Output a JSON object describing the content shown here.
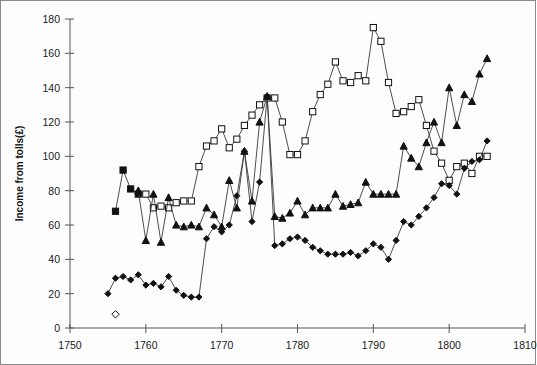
{
  "chart_data": {
    "type": "line",
    "title": "",
    "xlabel": "",
    "ylabel": "Income from tolls(£)",
    "xlim": [
      1750,
      1810
    ],
    "ylim": [
      0,
      180
    ],
    "xticks": [
      1750,
      1760,
      1770,
      1780,
      1790,
      1800,
      1810
    ],
    "yticks": [
      0,
      20,
      40,
      60,
      80,
      100,
      120,
      140,
      160,
      180
    ],
    "grid": false,
    "legend_position": "top-left",
    "series": [
      {
        "name": "Princethorpe",
        "marker": "filled-square",
        "x": [
          1756,
          1757,
          1758,
          1759
        ],
        "values": [
          68,
          92,
          81,
          78
        ]
      },
      {
        "name": "Stretton",
        "marker": "open-square",
        "x": [
          1760,
          1761,
          1762,
          1763,
          1764,
          1765,
          1766,
          1767,
          1768,
          1769,
          1770,
          1771,
          1772,
          1773,
          1774,
          1775,
          1776,
          1777,
          1778,
          1779,
          1780,
          1781,
          1782,
          1783,
          1784,
          1785,
          1786,
          1787,
          1788,
          1789,
          1790,
          1791,
          1792,
          1793,
          1794,
          1795,
          1796,
          1797,
          1798,
          1799,
          1800,
          1801,
          1802,
          1803,
          1804,
          1805
        ],
        "values": [
          78,
          70,
          71,
          70,
          73,
          74,
          74,
          94,
          106,
          109,
          116,
          105,
          110,
          118,
          124,
          130,
          134,
          134,
          120,
          101,
          101,
          109,
          126,
          136,
          142,
          155,
          144,
          143,
          147,
          144,
          175,
          167,
          143,
          125,
          126,
          129,
          133,
          118,
          103,
          96,
          86,
          94,
          96,
          90,
          100,
          100
        ]
      },
      {
        "name": "Ladbroke",
        "marker": "filled-diamond",
        "x": [
          1755,
          1756,
          1757,
          1758,
          1759,
          1760,
          1761,
          1762,
          1763,
          1764,
          1765,
          1766,
          1767,
          1768,
          1769,
          1770,
          1771,
          1772,
          1773,
          1774,
          1775,
          1776,
          1777,
          1778,
          1779,
          1780,
          1781,
          1782,
          1783,
          1784,
          1785,
          1786,
          1787,
          1788,
          1789,
          1790,
          1791,
          1792,
          1793,
          1794,
          1795,
          1796,
          1797,
          1798,
          1799,
          1800,
          1801,
          1802,
          1803,
          1804,
          1805
        ],
        "values": [
          20,
          29,
          30,
          28,
          31,
          25,
          26,
          24,
          30,
          22,
          19,
          18,
          18,
          52,
          59,
          56,
          60,
          77,
          103,
          62,
          85,
          135,
          48,
          49,
          52,
          53,
          51,
          47,
          45,
          43,
          43,
          43,
          44,
          42,
          45,
          49,
          47,
          40,
          51,
          62,
          60,
          65,
          70,
          76,
          84,
          83,
          78,
          93,
          97,
          98,
          109
        ]
      },
      {
        "name": "Snowsford",
        "marker": "open-diamond",
        "x": [
          1756
        ],
        "values": [
          8
        ]
      },
      {
        "name": "Hardwick",
        "marker": "filled-triangle",
        "x": [
          1759,
          1760,
          1761,
          1762,
          1763,
          1764,
          1765,
          1766,
          1767,
          1768,
          1769,
          1770,
          1771,
          1772,
          1773,
          1774,
          1775,
          1776,
          1777,
          1778,
          1779,
          1780,
          1781,
          1782,
          1783,
          1784,
          1785,
          1786,
          1787,
          1788,
          1789,
          1790,
          1791,
          1792,
          1793,
          1794,
          1795,
          1796,
          1797,
          1798,
          1799,
          1800,
          1801,
          1802,
          1803,
          1804,
          1805
        ],
        "values": [
          80,
          51,
          78,
          50,
          76,
          60,
          59,
          60,
          59,
          70,
          66,
          59,
          86,
          70,
          103,
          74,
          120,
          135,
          65,
          64,
          67,
          74,
          66,
          70,
          70,
          70,
          78,
          71,
          72,
          73,
          85,
          78,
          78,
          78,
          78,
          106,
          99,
          94,
          108,
          120,
          108,
          140,
          118,
          136,
          132,
          148,
          157
        ]
      }
    ]
  },
  "legend": {
    "entries": [
      {
        "label": "Princethorpe"
      },
      {
        "label": "Stretton"
      },
      {
        "label": "Ladbroke"
      },
      {
        "label": "Snowsford"
      },
      {
        "label": "Hardwick"
      }
    ]
  },
  "colors": {
    "line": "#3a3a3a",
    "marker_fill": "#111111",
    "marker_open": "#ffffff",
    "axis": "#555555",
    "frame": "#8a8a8a",
    "text": "#1a1a1a"
  }
}
